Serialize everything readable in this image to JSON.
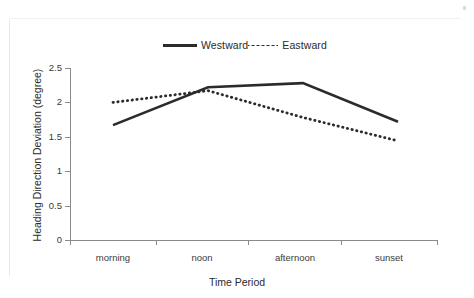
{
  "chart_data": {
    "type": "line",
    "title": "",
    "xlabel": "Time Period",
    "ylabel": "Heading Direction Deviation (degree)",
    "categories": [
      "morning",
      "noon",
      "afternoon",
      "sunset"
    ],
    "ylim": [
      0,
      2.5
    ],
    "yticks": [
      "0",
      "0.5",
      "1",
      "1.5",
      "2",
      "2.5"
    ],
    "ytick_values": [
      0,
      0.5,
      1,
      1.5,
      2,
      2.5
    ],
    "grid": false,
    "legend_position": "top-center",
    "series": [
      {
        "name": "Westward",
        "style": "solid",
        "color": "#2b2b2b",
        "values": [
          1.67,
          2.22,
          2.28,
          1.72
        ]
      },
      {
        "name": "Eastward",
        "style": "dotted",
        "color": "#2b2b2b",
        "values": [
          2.0,
          2.17,
          1.78,
          1.44
        ]
      }
    ]
  },
  "legend": {
    "entries": [
      {
        "label": "Westward",
        "style": "solid"
      },
      {
        "label": "Eastward",
        "style": "dotted"
      }
    ]
  },
  "axes": {
    "x_title": "Time Period",
    "y_title": "Heading Direction Deviation (degree)",
    "x_labels": [
      "morning",
      "noon",
      "afternoon",
      "sunset"
    ],
    "y_labels": [
      "2.5",
      "2",
      "1.5",
      "1",
      "0.5",
      "0"
    ]
  }
}
